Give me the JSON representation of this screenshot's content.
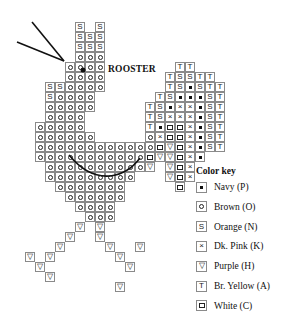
{
  "title": "ROOSTER",
  "color_key": {
    "heading": "Color key",
    "items": [
      {
        "symbol": "P",
        "glyph": "•",
        "label": "Navy (P)"
      },
      {
        "symbol": "O",
        "glyph": "○",
        "label": "Brown (O)"
      },
      {
        "symbol": "N",
        "glyph": "S",
        "label": "Orange (N)"
      },
      {
        "symbol": "K",
        "glyph": "×",
        "label": "Dk. Pink (K)"
      },
      {
        "symbol": "H",
        "glyph": "▽",
        "label": "Purple (H)"
      },
      {
        "symbol": "A",
        "glyph": "T",
        "label": "Br. Yellow (A)"
      },
      {
        "symbol": "C",
        "glyph": "□",
        "label": "White (C)"
      }
    ]
  },
  "grid": {
    "origin_x": 5,
    "origin_y": 22,
    "cell": 10,
    "rows": [
      ".......N.N............",
      ".......NNN............",
      ".......NNN............",
      ".......OOO............",
      "......OOOO.......AA...",
      "......OOOO......ANNAA.",
      "....NNOOOO......ANPNAA",
      "....NOOOO......ANPPPNA",
      "....OOOOO.....ANPKKPNA",
      "....OOOO......ANKKKPNA",
      "...OOOOO......APCCKPNA",
      "...OOOOOO.....OKCCKPNA",
      "...OOOOOOOOOOOOCHCKPNA",
      "...OOOOOOOOOOOCHHCKP..",
      "....OOOOOOOOOOH.HCK...",
      "....OOOOOOOOO...HCK...",
      ".....OOOOOOO.....C....",
      "......OOOOOO..........",
      ".......OOOO...........",
      "........OOO...........",
      ".......H.H............",
      "......H..H............",
      ".....H....H..H........",
      "..H.H......H..........",
      "...H........H.........",
      "....H.................",
      "...........H.........."
    ]
  },
  "glyphs": {
    "N": "S",
    "A": "T",
    "K": "×",
    "H": "▽"
  },
  "beak_lines": [
    {
      "x1": 32,
      "y1": 22,
      "x2": 64,
      "y2": 61
    },
    {
      "x1": 17,
      "y1": 42,
      "x2": 64,
      "y2": 61
    }
  ],
  "eye": {
    "x": 83,
    "y": 70,
    "r": 2.5
  },
  "wing_arc": {
    "path": "M 69 155 Q 88 178 110 176 Q 128 174 140 158"
  }
}
